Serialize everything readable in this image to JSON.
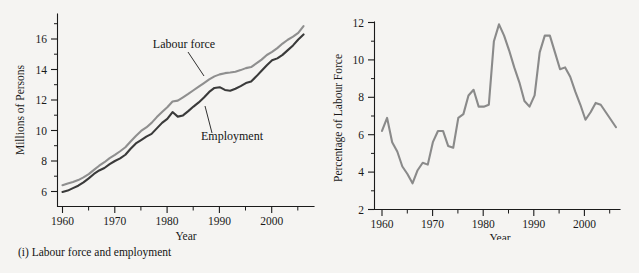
{
  "figure": {
    "background_color": "#f5f4f2",
    "panels": [
      {
        "id": "labour-force-employment",
        "caption": "(i) Labour force and employment",
        "xlabel": "Year",
        "ylabel": "Millions of Persons"
      },
      {
        "id": "unemployment-rate",
        "caption": "(ii) Unemployment rate",
        "xlabel": "Year",
        "ylabel": "Percentage of Labour Force"
      }
    ]
  },
  "chart_data": [
    {
      "type": "line",
      "id": "labour-force-employment",
      "title": "(i) Labour force and employment",
      "xlabel": "Year",
      "ylabel": "Millions of Persons",
      "xlim": [
        1958,
        2007
      ],
      "ylim": [
        5.3,
        17.6
      ],
      "xticks": [
        1960,
        1970,
        1980,
        1990,
        2000
      ],
      "xticklabels": [
        "1960",
        "1970",
        "1980",
        "1990",
        "2000"
      ],
      "xminorticks": [
        1965,
        1975,
        1985,
        1995,
        2005
      ],
      "yticks": [
        6,
        8,
        10,
        12,
        14,
        16
      ],
      "yticklabels": [
        "6",
        "8",
        "10",
        "12",
        "14",
        "16"
      ],
      "yminorticks": [
        7,
        9,
        11,
        13,
        15,
        17
      ],
      "grid": false,
      "legend": "annotations",
      "annotations": [
        {
          "text": "Labour force",
          "series": "Labour force",
          "x": 1982,
          "y": 14.7
        },
        {
          "text": "Employment",
          "series": "Employment",
          "x": 1988,
          "y": 11.3
        }
      ],
      "x": [
        1960,
        1961,
        1962,
        1963,
        1964,
        1965,
        1966,
        1967,
        1968,
        1969,
        1970,
        1971,
        1972,
        1973,
        1974,
        1975,
        1976,
        1977,
        1978,
        1979,
        1980,
        1981,
        1982,
        1983,
        1984,
        1985,
        1986,
        1987,
        1988,
        1989,
        1990,
        1991,
        1992,
        1993,
        1994,
        1995,
        1996,
        1997,
        1998,
        1999,
        2000,
        2001,
        2002,
        2003,
        2004,
        2005,
        2006
      ],
      "series": [
        {
          "name": "Labour force",
          "color": "#8f8f8f",
          "values": [
            6.41,
            6.52,
            6.62,
            6.75,
            6.93,
            7.14,
            7.42,
            7.69,
            7.92,
            8.19,
            8.4,
            8.64,
            8.9,
            9.28,
            9.64,
            9.97,
            10.2,
            10.5,
            10.88,
            11.21,
            11.52,
            11.9,
            11.96,
            12.18,
            12.4,
            12.64,
            12.87,
            13.11,
            13.35,
            13.55,
            13.68,
            13.76,
            13.8,
            13.85,
            13.96,
            14.09,
            14.16,
            14.4,
            14.65,
            14.95,
            15.15,
            15.4,
            15.7,
            15.95,
            16.15,
            16.4,
            16.85
          ]
        },
        {
          "name": "Employment",
          "color": "#3a3a3a",
          "values": [
            5.97,
            6.06,
            6.22,
            6.38,
            6.6,
            6.86,
            7.15,
            7.38,
            7.54,
            7.79,
            8.0,
            8.17,
            8.41,
            8.8,
            9.15,
            9.37,
            9.6,
            9.78,
            10.14,
            10.5,
            10.76,
            11.21,
            10.91,
            10.99,
            11.27,
            11.57,
            11.84,
            12.16,
            12.53,
            12.79,
            12.84,
            12.66,
            12.61,
            12.74,
            12.91,
            13.11,
            13.21,
            13.55,
            13.92,
            14.28,
            14.6,
            14.73,
            14.96,
            15.27,
            15.58,
            15.97,
            16.3
          ]
        }
      ]
    },
    {
      "type": "line",
      "id": "unemployment-rate",
      "title": "(ii) Unemployment rate",
      "xlabel": "Year",
      "ylabel": "Percentage of Labour Force",
      "xlim": [
        1958.5,
        2007
      ],
      "ylim": [
        2,
        12.6
      ],
      "xticks": [
        1960,
        1970,
        1980,
        1990,
        2000
      ],
      "xticklabels": [
        "1960",
        "1970",
        "1980",
        "1990",
        "2000"
      ],
      "xminorticks": [
        1965,
        1975,
        1985,
        1995,
        2005
      ],
      "yticks": [
        2,
        4,
        6,
        8,
        10,
        12
      ],
      "yticklabels": [
        "2",
        "4",
        "6",
        "8",
        "10",
        "12"
      ],
      "grid": false,
      "legend": "none",
      "x": [
        1960,
        1961,
        1962,
        1963,
        1964,
        1965,
        1966,
        1967,
        1968,
        1969,
        1970,
        1971,
        1972,
        1973,
        1974,
        1975,
        1976,
        1977,
        1978,
        1979,
        1980,
        1981,
        1982,
        1983,
        1984,
        1985,
        1986,
        1987,
        1988,
        1989,
        1990,
        1991,
        1992,
        1993,
        1994,
        1995,
        1996,
        1997,
        1998,
        1999,
        2000,
        2001,
        2002,
        2003,
        2004,
        2005,
        2006
      ],
      "series": [
        {
          "name": "Unemployment rate",
          "color": "#8a8a8a",
          "values": [
            6.2,
            6.9,
            5.6,
            5.1,
            4.3,
            3.9,
            3.4,
            4.1,
            4.5,
            4.4,
            5.6,
            6.2,
            6.2,
            5.4,
            5.3,
            6.9,
            7.1,
            8.1,
            8.4,
            7.5,
            7.5,
            7.6,
            11.0,
            11.9,
            11.3,
            10.5,
            9.6,
            8.8,
            7.8,
            7.5,
            8.1,
            10.4,
            11.3,
            11.3,
            10.4,
            9.5,
            9.6,
            9.1,
            8.3,
            7.6,
            6.8,
            7.2,
            7.7,
            7.6,
            7.2,
            6.8,
            6.4
          ]
        }
      ]
    }
  ]
}
